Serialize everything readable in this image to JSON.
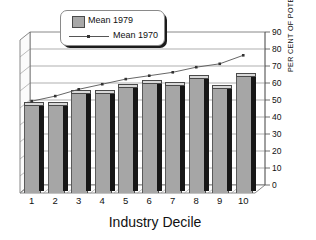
{
  "chart_data": {
    "type": "bar",
    "title": "",
    "subtitle": "",
    "xlabel": "Industry Decile",
    "ylabel": "PER CENT OF POTENTIAL",
    "categories": [
      "1",
      "2",
      "3",
      "4",
      "5",
      "6",
      "7",
      "8",
      "9",
      "10"
    ],
    "ylim": [
      0,
      90
    ],
    "ytick_labels": [
      "0",
      "10",
      "20",
      "30",
      "40",
      "50",
      "60",
      "70",
      "80",
      "90"
    ],
    "ytick_values": [
      0,
      10,
      20,
      30,
      40,
      50,
      60,
      70,
      80,
      90
    ],
    "grid": true,
    "legend_position": "top-left",
    "style": "3d-column-with-overlay-line",
    "series": [
      {
        "name": "Mean 1979",
        "type": "bar",
        "color": "#a6a6a6",
        "values": [
          51,
          51,
          58,
          58,
          62,
          64,
          63,
          67,
          61,
          68
        ]
      },
      {
        "name": "Mean 1970",
        "type": "line",
        "color": "#555555",
        "marker": "dot",
        "values": [
          50,
          53,
          57,
          60,
          63,
          65,
          67,
          70,
          72,
          77
        ]
      }
    ]
  },
  "legend": {
    "items": [
      {
        "label": "Mean 1979",
        "marker": "bar-swatch"
      },
      {
        "label": "Mean 1970",
        "marker": "line-with-dot"
      }
    ]
  },
  "axes": {
    "x_title": "Industry Decile",
    "y_title": "PER CENT OF POTENTIAL"
  }
}
